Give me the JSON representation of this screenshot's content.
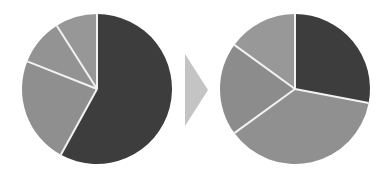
{
  "chart_data": [
    {
      "type": "pie",
      "title": "",
      "position": "left",
      "categories": [
        "Slice 1",
        "Slice 2",
        "Slice 3",
        "Slice 4"
      ],
      "values": [
        58,
        23,
        10,
        9
      ],
      "colors": [
        "#3d3d3d",
        "#8f8f8f",
        "#939393",
        "#979797"
      ],
      "start_angle_deg": 0,
      "direction": "clockwise",
      "legend": "none",
      "labels": "none"
    },
    {
      "type": "pie",
      "title": "",
      "position": "right",
      "categories": [
        "Slice 1",
        "Slice 2",
        "Slice 3",
        "Slice 4"
      ],
      "values": [
        28,
        37,
        20,
        15
      ],
      "colors": [
        "#3d3d3d",
        "#909090",
        "#8c8c8c",
        "#989898"
      ],
      "start_angle_deg": 0,
      "direction": "clockwise",
      "legend": "none",
      "labels": "none"
    }
  ],
  "arrow": {
    "direction": "right",
    "color": "#c4c4c4"
  },
  "layout": {
    "pies": [
      {
        "cx": 97,
        "cy": 89,
        "r": 75
      },
      {
        "cx": 295,
        "cy": 89,
        "r": 75
      }
    ],
    "separator_color": "#f2f2f2"
  }
}
